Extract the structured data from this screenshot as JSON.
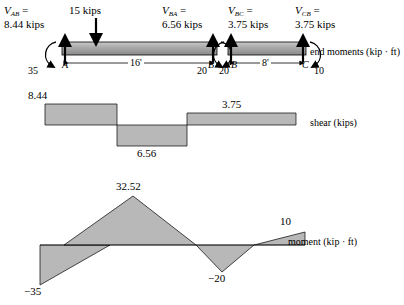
{
  "figure": {
    "title": "",
    "beam": {
      "span_ab_label": "16'",
      "span_bc_label": "8'",
      "node_a": "A",
      "node_b_left": "B",
      "node_b_right": "B",
      "node_c": "C",
      "point_load": "15 kips",
      "end_moment_35": "35",
      "end_moment_20_left": "20",
      "end_moment_20_right": "20",
      "end_moment_10": "10",
      "end_moments_caption": "end moments (kip · ft)",
      "reactions": [
        {
          "name": "V_AB",
          "symbol": "V",
          "sub": "AB",
          "value": "8.44 kips"
        },
        {
          "name": "V_BA",
          "symbol": "V",
          "sub": "BA",
          "value": "6.56 kips"
        },
        {
          "name": "V_BC",
          "symbol": "V",
          "sub": "BC",
          "value": "3.75 kips"
        },
        {
          "name": "V_CB",
          "symbol": "V",
          "sub": "CB",
          "value": "3.75 kips"
        }
      ]
    },
    "shear_diagram": {
      "caption": "shear (kips)",
      "labels": [
        {
          "text": "8.44",
          "position": "top-left"
        },
        {
          "text": "6.56",
          "position": "bottom-middle"
        },
        {
          "text": "3.75",
          "position": "top-right"
        }
      ]
    },
    "moment_diagram": {
      "caption": "moment (kip · ft)",
      "labels": [
        {
          "text": "32.52",
          "position": "peak"
        },
        {
          "text": "−35",
          "position": "left-end"
        },
        {
          "text": "−20",
          "position": "support-b"
        },
        {
          "text": "10",
          "position": "right-end"
        }
      ]
    },
    "colors": {
      "fill": "#b3b3b3",
      "beam_fill": "#9e9e9e",
      "stroke": "#000000"
    }
  }
}
